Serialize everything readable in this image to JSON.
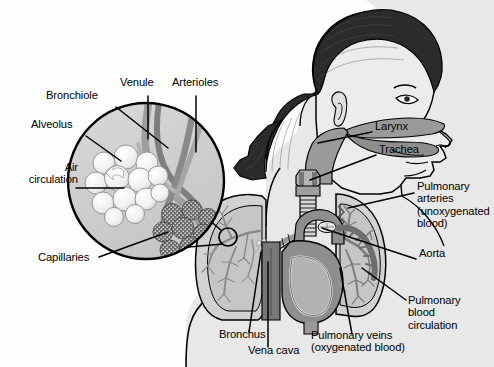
{
  "figure": {
    "type": "anatomical-diagram",
    "style": "grayscale line illustration",
    "background_color": "#fefefe",
    "line_color": "#000000"
  },
  "palette": {
    "outline": "#000000",
    "skin_fill": "#e8e8e8",
    "hair_fill": "#2b2b2b",
    "lung_fill": "#d2d2d2",
    "lung_inner": "#c0c0c0",
    "airway_fill": "#9a9a9a",
    "heart_fill": "#8e8e8e",
    "vessel_dark": "#6e6e6e",
    "vena_cava_fill": "#787878",
    "inset_fill": "#cfcfcf",
    "alveoli_fill": "#f2f2f2",
    "capillary_fill": "#6a6a6a"
  },
  "inset": {
    "name": "alveoli-magnifier",
    "shape": "circle",
    "center_x": 146,
    "center_y": 181,
    "radius": 79,
    "source_marker_x": 228,
    "source_marker_y": 237,
    "source_marker_radius": 9
  },
  "labels": [
    {
      "id": "bronchiole",
      "text": "Bronchiole",
      "x": 46,
      "y": 95,
      "align": "left",
      "leader": [
        [
          116,
          107
        ],
        [
          168,
          148
        ]
      ]
    },
    {
      "id": "alveolus",
      "text": "Alveolus",
      "x": 31,
      "y": 124,
      "align": "left",
      "leader": [
        [
          86,
          136
        ],
        [
          121,
          161
        ]
      ]
    },
    {
      "id": "air-circulation",
      "text": "Air\ncirculation",
      "x": 10,
      "y": 167,
      "align": "left",
      "leader": [
        [
          76,
          188
        ],
        [
          124,
          188
        ]
      ]
    },
    {
      "id": "capillaries",
      "text": "Capillaries",
      "x": 38,
      "y": 257,
      "align": "left",
      "leader": [
        [
          99,
          257
        ],
        [
          168,
          232
        ]
      ]
    },
    {
      "id": "venule",
      "text": "Venule",
      "x": 120,
      "y": 82,
      "align": "left",
      "leader": [
        [
          148,
          96
        ],
        [
          148,
          139
        ]
      ]
    },
    {
      "id": "arterioles",
      "text": "Arterioles",
      "x": 172,
      "y": 82,
      "align": "left",
      "leader": [
        [
          196,
          96
        ],
        [
          196,
          152
        ]
      ]
    },
    {
      "id": "larynx",
      "text": "Larynx",
      "x": 375,
      "y": 126,
      "align": "left",
      "leader": [
        [
          372,
          132
        ],
        [
          318,
          143
        ]
      ]
    },
    {
      "id": "trachea",
      "text": "Trachea",
      "x": 379,
      "y": 149,
      "align": "left",
      "leader": [
        [
          376,
          155
        ],
        [
          310,
          180
        ]
      ]
    },
    {
      "id": "pulmonary-arteries",
      "text": "Pulmonary\narteries\n(unoxygenated\nblood)",
      "x": 417,
      "y": 186,
      "align": "left",
      "leader": [
        [
          414,
          193
        ],
        [
          348,
          208
        ]
      ]
    },
    {
      "id": "aorta",
      "text": "Aorta",
      "x": 419,
      "y": 253,
      "align": "left",
      "leader": [
        [
          416,
          259
        ],
        [
          322,
          228
        ]
      ]
    },
    {
      "id": "pulmonary-blood-circulation",
      "text": "Pulmonary\nblood\ncirculation",
      "x": 408,
      "y": 300,
      "align": "left",
      "leader": [
        [
          406,
          300
        ],
        [
          362,
          268
        ]
      ]
    },
    {
      "id": "bronchus",
      "text": "Bronchus",
      "x": 219,
      "y": 334,
      "align": "left",
      "leader": [
        [
          249,
          332
        ],
        [
          261,
          252
        ]
      ]
    },
    {
      "id": "vena-cava",
      "text": "Vena cava",
      "x": 248,
      "y": 350,
      "align": "left",
      "leader": [
        [
          268,
          347
        ],
        [
          268,
          262
        ]
      ]
    },
    {
      "id": "pulmonary-veins",
      "text": "Pulmonary veins\n(oxygenated blood)",
      "x": 311,
      "y": 335,
      "align": "left",
      "leader": [
        [
          352,
          334
        ],
        [
          340,
          268
        ]
      ]
    }
  ],
  "structures": [
    {
      "id": "head-profile",
      "name": "female head in right profile with ponytail"
    },
    {
      "id": "nasal-oral-airway",
      "name": "shaded nasal cavity and pharynx"
    },
    {
      "id": "larynx-structure",
      "name": "larynx"
    },
    {
      "id": "trachea-structure",
      "name": "trachea with cartilage rings"
    },
    {
      "id": "left-lung",
      "name": "left lung with bronchial tree"
    },
    {
      "id": "right-lung",
      "name": "right lung with bronchial tree"
    },
    {
      "id": "heart",
      "name": "heart"
    },
    {
      "id": "vena-cava-structure",
      "name": "vena cava"
    },
    {
      "id": "aorta-structure",
      "name": "aortic arch"
    },
    {
      "id": "alveoli-cluster",
      "name": "cluster of alveoli"
    },
    {
      "id": "capillary-network",
      "name": "capillary covered alveoli"
    },
    {
      "id": "venule-vessel",
      "name": "venule"
    },
    {
      "id": "arteriole-vessel",
      "name": "arteriole"
    }
  ]
}
